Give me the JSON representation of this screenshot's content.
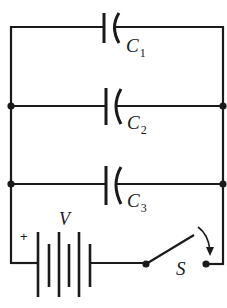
{
  "diagram": {
    "type": "circuit",
    "colors": {
      "line": "#1a1a1a",
      "background": "#ffffff"
    },
    "components": {
      "capacitors": [
        {
          "id": "C1",
          "label": "C",
          "subscript": "1"
        },
        {
          "id": "C2",
          "label": "C",
          "subscript": "2"
        },
        {
          "id": "C3",
          "label": "C",
          "subscript": "3"
        }
      ],
      "battery": {
        "label": "V",
        "polarity_mark": "+"
      },
      "switch": {
        "label": "S",
        "state": "open",
        "closing_arrow": true
      }
    },
    "junctions": 4
  }
}
